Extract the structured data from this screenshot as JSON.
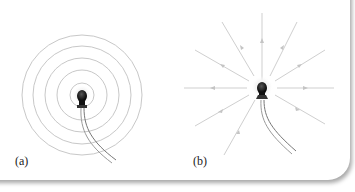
{
  "figure": {
    "panels": [
      {
        "id": "a",
        "label": "(a)",
        "description": "Light bulb with concentric circular wavefronts"
      },
      {
        "id": "b",
        "label": "(b)",
        "description": "Light bulb with radial rays with arrows pointing outward"
      }
    ],
    "colors": {
      "lines": "#c8c8c8",
      "rays": "#cfcfcf",
      "bulb": "#111111",
      "wire": "#8a8a8a"
    },
    "panel_a": {
      "center": [
        82,
        95
      ],
      "circle_radii": [
        12,
        25,
        37,
        49,
        60
      ]
    },
    "panel_b": {
      "center": [
        262,
        87
      ],
      "ray_count": 12
    }
  }
}
